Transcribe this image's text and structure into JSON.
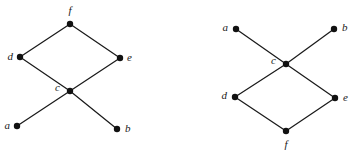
{
  "figure": {
    "background_color": "#ffffff",
    "ink_color": "#1a1a1a",
    "node_fill_color": "#111111",
    "width": 354,
    "height": 155
  },
  "diagrams": [
    {
      "id": "left-diagram",
      "name": "left-hasse-diagram",
      "nodes": [
        {
          "id": "f",
          "label": "f",
          "x": 70,
          "y": 24,
          "label_x": 70,
          "label_y": 11,
          "label_anchor": "middle"
        },
        {
          "id": "d",
          "label": "d",
          "x": 20,
          "y": 57,
          "label_x": 13,
          "label_y": 57,
          "label_anchor": "end"
        },
        {
          "id": "e",
          "label": "e",
          "x": 120,
          "y": 58,
          "label_x": 127,
          "label_y": 58,
          "label_anchor": "start"
        },
        {
          "id": "c",
          "label": "c",
          "x": 70,
          "y": 91,
          "label_x": 60,
          "label_y": 88,
          "label_anchor": "end"
        },
        {
          "id": "a",
          "label": "a",
          "x": 17,
          "y": 126,
          "label_x": 10,
          "label_y": 126,
          "label_anchor": "end"
        },
        {
          "id": "b",
          "label": "b",
          "x": 117,
          "y": 129,
          "label_x": 125,
          "label_y": 129,
          "label_anchor": "start"
        }
      ],
      "edges": [
        {
          "from": "d",
          "to": "f"
        },
        {
          "from": "e",
          "to": "f"
        },
        {
          "from": "c",
          "to": "d"
        },
        {
          "from": "c",
          "to": "e"
        },
        {
          "from": "a",
          "to": "c"
        },
        {
          "from": "b",
          "to": "c"
        }
      ]
    },
    {
      "id": "right-diagram",
      "name": "right-hasse-diagram",
      "nodes": [
        {
          "id": "a",
          "label": "a",
          "x": 236,
          "y": 29,
          "label_x": 228,
          "label_y": 28,
          "label_anchor": "end"
        },
        {
          "id": "b",
          "label": "b",
          "x": 334,
          "y": 29,
          "label_x": 342,
          "label_y": 28,
          "label_anchor": "start"
        },
        {
          "id": "c",
          "label": "c",
          "x": 286,
          "y": 64,
          "label_x": 276,
          "label_y": 61,
          "label_anchor": "end"
        },
        {
          "id": "d",
          "label": "d",
          "x": 235,
          "y": 97,
          "label_x": 227,
          "label_y": 96,
          "label_anchor": "end"
        },
        {
          "id": "e",
          "label": "e",
          "x": 335,
          "y": 98,
          "label_x": 343,
          "label_y": 98,
          "label_anchor": "start"
        },
        {
          "id": "f",
          "label": "f",
          "x": 286,
          "y": 131,
          "label_x": 286,
          "label_y": 145,
          "label_anchor": "middle"
        }
      ],
      "edges": [
        {
          "from": "a",
          "to": "c"
        },
        {
          "from": "b",
          "to": "c"
        },
        {
          "from": "c",
          "to": "d"
        },
        {
          "from": "c",
          "to": "e"
        },
        {
          "from": "d",
          "to": "f"
        },
        {
          "from": "e",
          "to": "f"
        }
      ]
    }
  ],
  "node_radius": 3.2
}
